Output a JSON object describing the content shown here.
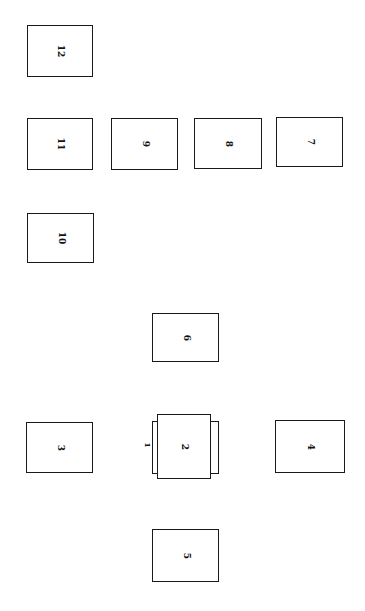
{
  "header": {
    "page_number": "",
    "running_title": ""
  },
  "diagram": {
    "label_orientation": "rotated 90deg clockwise",
    "stroke_color": "#1a1a1a",
    "background_color": "#ffffff",
    "boxes": [
      {
        "id": "1",
        "label": "1",
        "x": 152,
        "y": 421,
        "w": 67,
        "h": 53,
        "note": "underneath box 2, label shown at left edge"
      },
      {
        "id": "2",
        "label": "2",
        "x": 157,
        "y": 414,
        "w": 54,
        "h": 65,
        "note": "crosses over box 1"
      },
      {
        "id": "3",
        "label": "3",
        "x": 26,
        "y": 422,
        "w": 67,
        "h": 51
      },
      {
        "id": "4",
        "label": "4",
        "x": 275,
        "y": 420,
        "w": 70,
        "h": 53
      },
      {
        "id": "5",
        "label": "5",
        "x": 152,
        "y": 529,
        "w": 67,
        "h": 53
      },
      {
        "id": "6",
        "label": "6",
        "x": 152,
        "y": 313,
        "w": 67,
        "h": 49
      },
      {
        "id": "7",
        "label": "7",
        "x": 276,
        "y": 117,
        "w": 67,
        "h": 50
      },
      {
        "id": "8",
        "label": "8",
        "x": 194,
        "y": 118,
        "w": 68,
        "h": 51
      },
      {
        "id": "9",
        "label": "9",
        "x": 111,
        "y": 118,
        "w": 67,
        "h": 52
      },
      {
        "id": "10",
        "label": "10",
        "x": 27,
        "y": 213,
        "w": 67,
        "h": 50
      },
      {
        "id": "11",
        "label": "11",
        "x": 27,
        "y": 118,
        "w": 66,
        "h": 52
      },
      {
        "id": "12",
        "label": "12",
        "x": 27,
        "y": 25,
        "w": 66,
        "h": 52
      }
    ]
  }
}
